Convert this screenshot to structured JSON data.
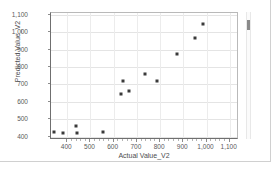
{
  "chart_data": {
    "type": "scatter",
    "title": "",
    "xlabel": "Actual Value_V2",
    "ylabel": "Predicted Value_V2",
    "xlim": [
      330,
      1140
    ],
    "ylim": [
      380,
      1110
    ],
    "xticks": [
      400,
      500,
      600,
      700,
      800,
      900,
      1000,
      1100
    ],
    "xtick_labels": [
      "400",
      "500",
      "600",
      "700",
      "800",
      "900",
      "1,000",
      "1,100"
    ],
    "yticks": [
      400,
      500,
      600,
      700,
      800,
      900,
      1000,
      1100
    ],
    "ytick_labels": [
      "400",
      "500",
      "600",
      "700",
      "800",
      "900",
      "1,000",
      "1,100"
    ],
    "grid": true,
    "legend": false,
    "marker_color": "#3a3a3a",
    "points": [
      {
        "x": 345,
        "y": 425
      },
      {
        "x": 380,
        "y": 418
      },
      {
        "x": 437,
        "y": 462
      },
      {
        "x": 440,
        "y": 418
      },
      {
        "x": 555,
        "y": 425
      },
      {
        "x": 633,
        "y": 643
      },
      {
        "x": 640,
        "y": 722
      },
      {
        "x": 668,
        "y": 663
      },
      {
        "x": 733,
        "y": 762
      },
      {
        "x": 788,
        "y": 720
      },
      {
        "x": 875,
        "y": 872
      },
      {
        "x": 950,
        "y": 967
      },
      {
        "x": 985,
        "y": 1048
      }
    ]
  },
  "panel": {
    "background_color": "#ffffff",
    "border_color": "#d0d0d0"
  },
  "scrollbar": {
    "name": "vertical-scrollbar",
    "thumb_color": "#8a8a8a"
  }
}
